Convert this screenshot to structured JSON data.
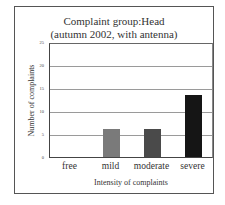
{
  "chart_data": {
    "type": "bar",
    "title": "Complaint group:Head",
    "subtitle": "(autumn 2002, with antenna)",
    "xlabel": "Intensity of complaints",
    "ylabel": "Number of complaints",
    "categories": [
      "free",
      "mild",
      "moderate",
      "severe"
    ],
    "values": [
      0,
      6,
      6,
      13.5
    ],
    "bar_colors": [
      "#7a7a7a",
      "#7a7a7a",
      "#4a4a4a",
      "#151515"
    ],
    "ylim": [
      0,
      25
    ],
    "yticks": [
      "0",
      "5",
      "10",
      "15",
      "20",
      "25"
    ],
    "grid": true,
    "legend": null
  }
}
